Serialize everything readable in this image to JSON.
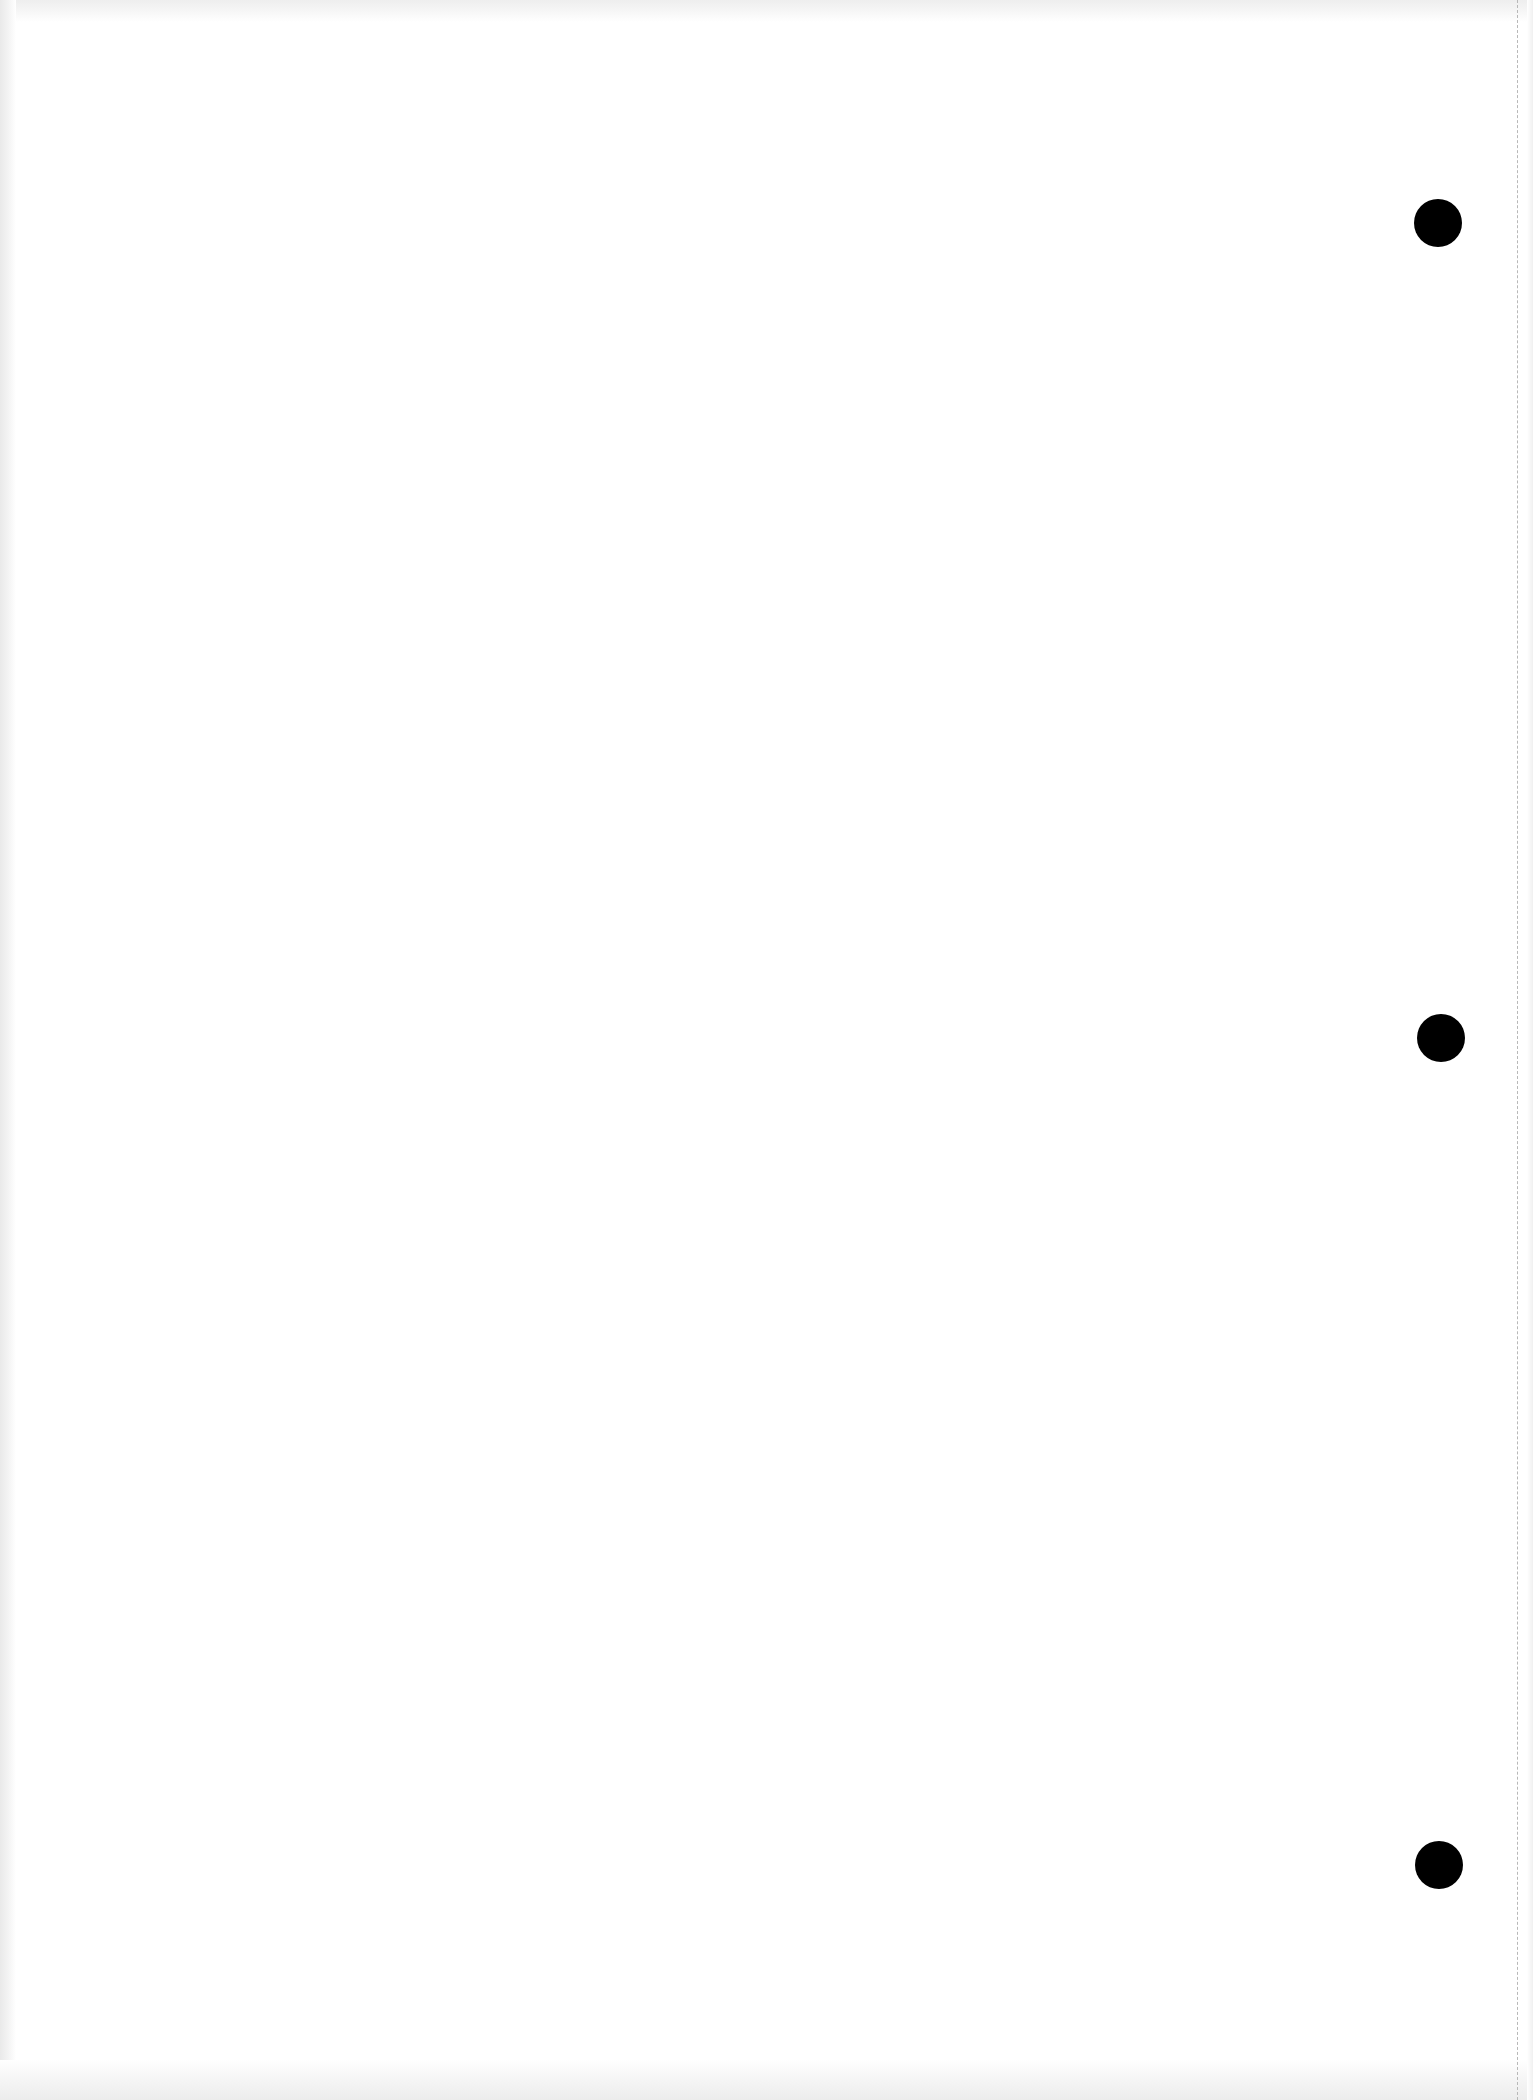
{
  "document": {
    "type": "blank-page-scan",
    "text_content": [],
    "punch_holes": [
      {
        "x": 1438,
        "y": 223
      },
      {
        "x": 1441,
        "y": 1038
      },
      {
        "x": 1439,
        "y": 1865
      }
    ],
    "colors": {
      "paper": "#ffffff",
      "hole": "#000000",
      "perforation": "#b8b8b8",
      "edge_shade": "#e9e9e9"
    }
  }
}
